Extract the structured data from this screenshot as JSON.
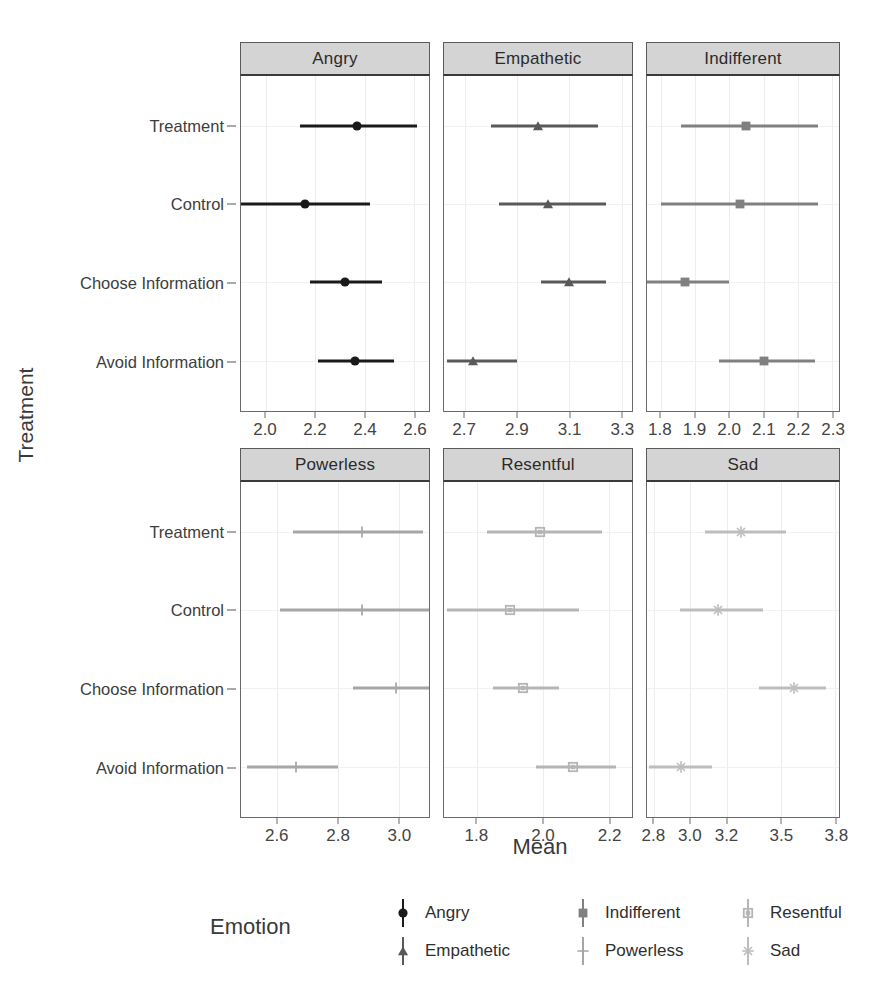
{
  "axes": {
    "y_title": "Treatment",
    "x_title": "Mean"
  },
  "legend": {
    "title": "Emotion",
    "items": [
      {
        "label": "Angry",
        "marker": "filled-circle",
        "color": "#1a1a1a"
      },
      {
        "label": "Empathetic",
        "marker": "filled-triangle",
        "color": "#595959"
      },
      {
        "label": "Indifferent",
        "marker": "filled-square",
        "color": "#808080"
      },
      {
        "label": "Powerless",
        "marker": "plus",
        "color": "#a6a6a6"
      },
      {
        "label": "Resentful",
        "marker": "open-square",
        "color": "#b5b5b5"
      },
      {
        "label": "Sad",
        "marker": "asterisk",
        "color": "#bdbdbd"
      }
    ]
  },
  "chart_data": {
    "type": "scatter",
    "title": "",
    "xlabel": "Mean",
    "ylabel": "Treatment",
    "grid": true,
    "legend_position": "bottom",
    "facet_variable": "Emotion",
    "categories": [
      "Treatment",
      "Control",
      "Choose Information",
      "Avoid Information"
    ],
    "panels": [
      {
        "name": "Angry",
        "marker": "filled-circle",
        "color": "#1a1a1a",
        "xlim": [
          1.9,
          2.66
        ],
        "ticks": [
          2.0,
          2.2,
          2.4,
          2.6
        ],
        "points": [
          {
            "category": "Treatment",
            "mean": 2.37,
            "low": 2.14,
            "high": 2.61
          },
          {
            "category": "Control",
            "mean": 2.16,
            "low": 1.9,
            "high": 2.42
          },
          {
            "category": "Choose Information",
            "mean": 2.32,
            "low": 2.18,
            "high": 2.47
          },
          {
            "category": "Avoid Information",
            "mean": 2.36,
            "low": 2.21,
            "high": 2.52
          }
        ]
      },
      {
        "name": "Empathetic",
        "marker": "filled-triangle",
        "color": "#595959",
        "xlim": [
          2.62,
          3.34
        ],
        "ticks": [
          2.7,
          2.9,
          3.1,
          3.3
        ],
        "points": [
          {
            "category": "Treatment",
            "mean": 2.98,
            "low": 2.8,
            "high": 3.21
          },
          {
            "category": "Control",
            "mean": 3.02,
            "low": 2.83,
            "high": 3.24
          },
          {
            "category": "Choose Information",
            "mean": 3.1,
            "low": 2.99,
            "high": 3.24
          },
          {
            "category": "Avoid Information",
            "mean": 2.73,
            "low": 2.63,
            "high": 2.9
          }
        ]
      },
      {
        "name": "Indifferent",
        "marker": "filled-square",
        "color": "#808080",
        "xlim": [
          1.76,
          2.32
        ],
        "ticks": [
          1.8,
          1.9,
          2.0,
          2.1,
          2.2,
          2.3
        ],
        "points": [
          {
            "category": "Treatment",
            "mean": 2.05,
            "low": 1.86,
            "high": 2.26
          },
          {
            "category": "Control",
            "mean": 2.03,
            "low": 1.8,
            "high": 2.26
          },
          {
            "category": "Choose Information",
            "mean": 1.87,
            "low": 1.76,
            "high": 2.0
          },
          {
            "category": "Avoid Information",
            "mean": 2.1,
            "low": 1.97,
            "high": 2.25
          }
        ]
      },
      {
        "name": "Powerless",
        "marker": "plus",
        "color": "#a6a6a6",
        "xlim": [
          2.48,
          3.1
        ],
        "ticks": [
          2.6,
          2.8,
          3.0
        ],
        "points": [
          {
            "category": "Treatment",
            "mean": 2.88,
            "low": 2.65,
            "high": 3.08
          },
          {
            "category": "Control",
            "mean": 2.88,
            "low": 2.61,
            "high": 3.1
          },
          {
            "category": "Choose Information",
            "mean": 2.99,
            "low": 2.85,
            "high": 3.1
          },
          {
            "category": "Avoid Information",
            "mean": 2.66,
            "low": 2.5,
            "high": 2.8
          }
        ]
      },
      {
        "name": "Resentful",
        "marker": "open-square",
        "color": "#b5b5b5",
        "xlim": [
          1.7,
          2.27
        ],
        "ticks": [
          1.8,
          2.0,
          2.2
        ],
        "points": [
          {
            "category": "Treatment",
            "mean": 1.99,
            "low": 1.83,
            "high": 2.18
          },
          {
            "category": "Control",
            "mean": 1.9,
            "low": 1.71,
            "high": 2.11
          },
          {
            "category": "Choose Information",
            "mean": 1.94,
            "low": 1.85,
            "high": 2.05
          },
          {
            "category": "Avoid Information",
            "mean": 2.09,
            "low": 1.98,
            "high": 2.22
          }
        ]
      },
      {
        "name": "Sad",
        "marker": "asterisk",
        "color": "#bdbdbd",
        "xlim": [
          2.76,
          3.82
        ],
        "ticks": [
          2.8,
          3.0,
          3.2,
          3.5,
          3.8
        ],
        "points": [
          {
            "category": "Treatment",
            "mean": 3.28,
            "low": 3.08,
            "high": 3.53
          },
          {
            "category": "Control",
            "mean": 3.15,
            "low": 2.94,
            "high": 3.4
          },
          {
            "category": "Choose Information",
            "mean": 3.57,
            "low": 3.38,
            "high": 3.75
          },
          {
            "category": "Avoid Information",
            "mean": 2.95,
            "low": 2.77,
            "high": 3.12
          }
        ]
      }
    ]
  }
}
